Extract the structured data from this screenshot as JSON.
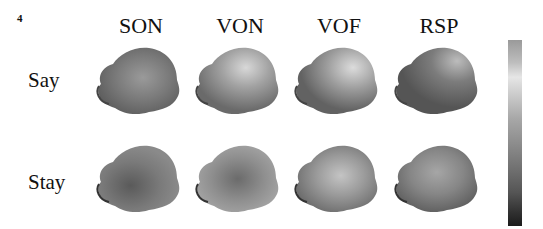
{
  "figure": {
    "panel_number": "4",
    "columns": [
      "SON",
      "VON",
      "VOF",
      "RSP"
    ],
    "rows": [
      "Say",
      "Stay"
    ],
    "colorbar": {
      "orientation": "vertical",
      "scale": "grayscale",
      "top_color": "#e6e6e6",
      "bottom_color": "#1b1b1b"
    }
  }
}
